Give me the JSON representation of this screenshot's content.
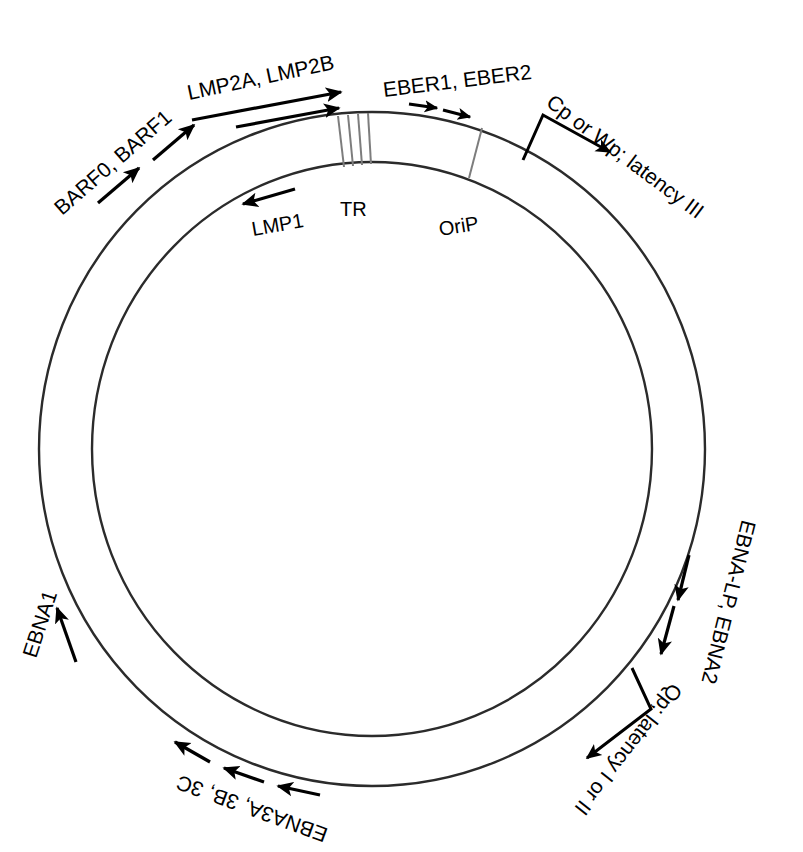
{
  "figure": {
    "type": "epstein-barr-virus-genome-map",
    "shape": "double-circle",
    "background_color": "#ffffff",
    "line_color": "#2b2b2b",
    "marker_color": "#7d7d7d"
  },
  "inner_markers": [
    {
      "id": "tr",
      "label": "TR",
      "kind": "hatched-segment",
      "stripe_count": 4,
      "angle_deg": -84
    },
    {
      "id": "orip",
      "label": "OriP",
      "kind": "single-line",
      "stripe_count": 1,
      "angle_deg": -60
    }
  ],
  "outer_labels": [
    {
      "id": "barf",
      "text": "BARF0, BARF1",
      "arrows": 2,
      "direction": "clockwise",
      "angle_deg": -152
    },
    {
      "id": "lmp2",
      "text": "LMP2A, LMP2B",
      "arrows": 2,
      "direction": "clockwise",
      "angle_deg": -110
    },
    {
      "id": "eber",
      "text": "EBER1, EBER2",
      "arrows": 2,
      "direction": "clockwise",
      "angle_deg": -72
    },
    {
      "id": "cpwp",
      "text": "Cp or Wp; latency III",
      "arrows": 1,
      "direction": "promoter-bracket",
      "angle_deg": -45
    },
    {
      "id": "ebnalp",
      "text": "EBNA-LP, EBNA2",
      "arrows": 2,
      "direction": "clockwise",
      "angle_deg": 22
    },
    {
      "id": "qp",
      "text": "Qp; latency I or II",
      "arrows": 1,
      "direction": "promoter-bracket",
      "angle_deg": 52
    },
    {
      "id": "ebna3",
      "text": "EBNA3A, 3B, 3C",
      "arrows": 3,
      "direction": "clockwise",
      "angle_deg": 108
    },
    {
      "id": "ebna1",
      "text": "EBNA1",
      "arrows": 1,
      "direction": "clockwise",
      "angle_deg": 152
    }
  ],
  "inner_labels": [
    {
      "id": "lmp1",
      "text": "LMP1",
      "arrows": 1,
      "direction": "counter-clockwise",
      "angle_deg": -118
    },
    {
      "id": "tr_label",
      "text": "TR"
    },
    {
      "id": "orip_label",
      "text": "OriP"
    }
  ],
  "text": {
    "barf": "BARF0, BARF1",
    "lmp2": "LMP2A, LMP2B",
    "eber": "EBER1, EBER2",
    "cpwp": "Cp or Wp; latency III",
    "ebnalp": "EBNA-LP, EBNA2",
    "qp": "Qp; latency I or II",
    "ebna3": "EBNA3A, 3B, 3C",
    "ebna1": "EBNA1",
    "lmp1": "LMP1",
    "tr": "TR",
    "orip": "OriP"
  }
}
